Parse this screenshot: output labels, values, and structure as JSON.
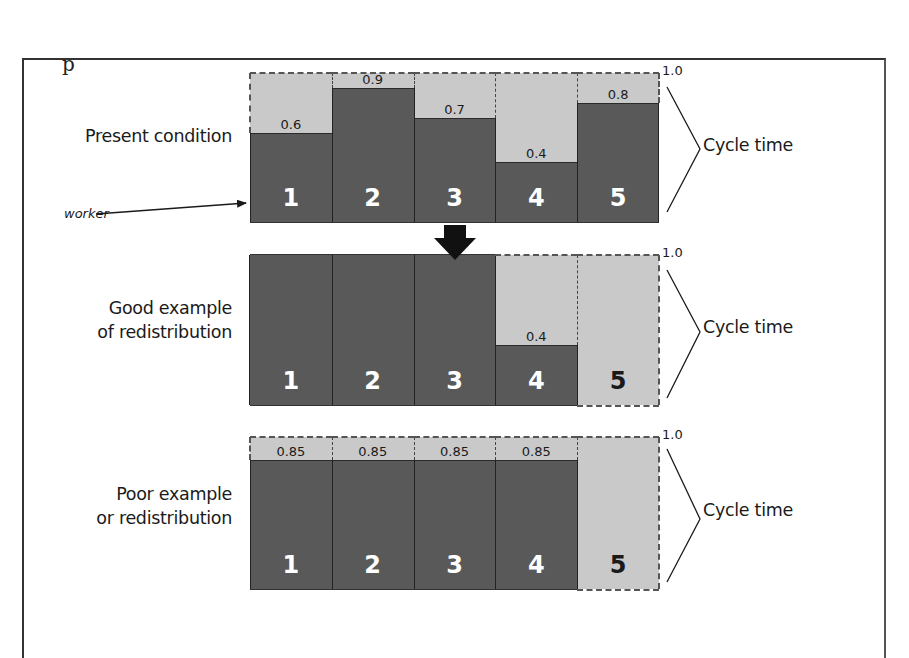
{
  "figure": {
    "corner_glyph": "p",
    "scale_top_label": "1.0",
    "bracket_label": "Cycle time",
    "worker_annotation": "worker",
    "colors": {
      "work": "#595959",
      "idle": "#c9c9c9",
      "outline": "#2a2a2a",
      "worker_number": "#ffffff",
      "idle_worker_number": "#1a1a1a"
    }
  },
  "rows": [
    {
      "label_lines": [
        "Present condition"
      ],
      "workers": [
        {
          "id": "1",
          "load": 0.6,
          "load_label": "0.6"
        },
        {
          "id": "2",
          "load": 0.9,
          "load_label": "0.9"
        },
        {
          "id": "3",
          "load": 0.7,
          "load_label": "0.7"
        },
        {
          "id": "4",
          "load": 0.4,
          "load_label": "0.4"
        },
        {
          "id": "5",
          "load": 0.8,
          "load_label": "0.8"
        }
      ]
    },
    {
      "label_lines": [
        "Good example",
        "of redistribution"
      ],
      "workers": [
        {
          "id": "1",
          "load": 1.0,
          "load_label": ""
        },
        {
          "id": "2",
          "load": 1.0,
          "load_label": ""
        },
        {
          "id": "3",
          "load": 1.0,
          "load_label": ""
        },
        {
          "id": "4",
          "load": 0.4,
          "load_label": "0.4"
        },
        {
          "id": "5",
          "load": 0.0,
          "load_label": ""
        }
      ]
    },
    {
      "label_lines": [
        "Poor example",
        "or redistribution"
      ],
      "workers": [
        {
          "id": "1",
          "load": 0.85,
          "load_label": "0.85"
        },
        {
          "id": "2",
          "load": 0.85,
          "load_label": "0.85"
        },
        {
          "id": "3",
          "load": 0.85,
          "load_label": "0.85"
        },
        {
          "id": "4",
          "load": 0.85,
          "load_label": "0.85"
        },
        {
          "id": "5",
          "load": 0.0,
          "load_label": ""
        }
      ]
    }
  ],
  "chart_data": {
    "type": "bar",
    "title": "",
    "categories": [
      "1",
      "2",
      "3",
      "4",
      "5"
    ],
    "xlabel": "worker",
    "ylabel": "Cycle time",
    "ylim": [
      0,
      1.0
    ],
    "series": [
      {
        "name": "Present condition",
        "values": [
          0.6,
          0.9,
          0.7,
          0.4,
          0.8
        ]
      },
      {
        "name": "Good example of redistribution",
        "values": [
          1.0,
          1.0,
          1.0,
          0.4,
          0.0
        ]
      },
      {
        "name": "Poor example or redistribution",
        "values": [
          0.85,
          0.85,
          0.85,
          0.85,
          0.0
        ]
      }
    ]
  }
}
